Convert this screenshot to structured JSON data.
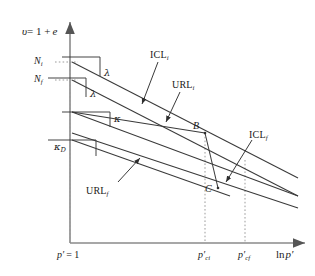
{
  "figure": {
    "type": "diagram",
    "background": "#ffffff",
    "line_color": "#3a3a3a",
    "axis_color": "#808080",
    "width": 315,
    "height": 276
  },
  "axes": {
    "y_axis_label": "υ = 1 + e",
    "y_axis_label_parts": {
      "symbol": "υ",
      "equals": "= 1 +",
      "e": "e"
    },
    "x_axis_label": "ln p′",
    "x_axis_label_parts": {
      "ln": "ln",
      "p": "p′"
    },
    "y_ticks": [
      {
        "label_base": "N",
        "label_sub": "i",
        "value_y_px": 62
      },
      {
        "label_base": "N",
        "label_sub": "f",
        "value_y_px": 80
      }
    ],
    "x_ticks": [
      {
        "label": "p′ = 1",
        "base": "p′",
        "eq": "= 1",
        "value_x_px": 70
      },
      {
        "label": "p′ci",
        "base": "p′",
        "sub": "ci",
        "value_x_px": 205
      },
      {
        "label": "p′cf",
        "base": "p′",
        "sub": "cf",
        "value_x_px": 245
      }
    ]
  },
  "lines": [
    {
      "name": "ICL_i",
      "label_base": "ICL",
      "label_sub": "i",
      "slope_symbol": "λ",
      "description": "isotropic compression line, initial"
    },
    {
      "name": "ICL_f",
      "label_base": "ICL",
      "label_sub": "f",
      "slope_symbol": "λ",
      "description": "isotropic compression line, final"
    },
    {
      "name": "URL_i",
      "label_base": "URL",
      "label_sub": "i",
      "slope_symbol": "κ",
      "description": "unload-reload line, initial"
    },
    {
      "name": "URL_f",
      "label_base": "URL",
      "label_sub": "f",
      "slope_symbol": "κ",
      "description": "unload-reload line, final"
    }
  ],
  "slope_labels": [
    {
      "symbol": "λ",
      "sub": "",
      "x": 84,
      "y": 73
    },
    {
      "symbol": "λ",
      "sub": "",
      "x": 70,
      "y": 92
    },
    {
      "symbol": "κ",
      "sub": "",
      "x": 95,
      "y": 120
    },
    {
      "symbol": "κ",
      "sub": "D",
      "x": 60,
      "y": 148
    }
  ],
  "curve_labels": [
    {
      "base": "ICL",
      "sub": "i",
      "x": 152,
      "y": 52
    },
    {
      "base": "URL",
      "sub": "i",
      "x": 176,
      "y": 82
    },
    {
      "base": "ICL",
      "sub": "f",
      "x": 252,
      "y": 132
    },
    {
      "base": "URL",
      "sub": "f",
      "x": 90,
      "y": 188
    }
  ],
  "points": [
    {
      "label": "B",
      "x": 205,
      "y": 133,
      "label_x": 193,
      "label_y": 123
    },
    {
      "label": "C",
      "x": 218,
      "y": 188,
      "label_x": 206,
      "label_y": 186
    }
  ]
}
